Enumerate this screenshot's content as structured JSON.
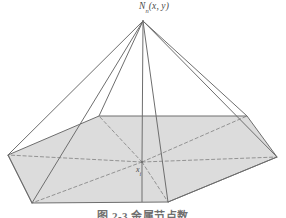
{
  "figure": {
    "domain": "geometric-diagram",
    "background_color": "#ffffff",
    "stroke_color": "#6e6e6e",
    "dashed_stroke_color": "#8a8a8a",
    "fill_color": "#dcdcdc",
    "label_color": "#4a4a4a",
    "caption_color": "#6f6f6f",
    "width": 286,
    "height": 218
  },
  "labels": {
    "apex_main": "N",
    "apex_subscript": "n",
    "apex_args": "(x, y)",
    "apex_full": "Nn(x, y)",
    "center_main": "x",
    "center_subscript": "i",
    "center_full": "xi"
  },
  "caption": {
    "text": "图 2-3  金属节点数"
  },
  "geometry": {
    "apex": {
      "x": 143,
      "y": 21,
      "name": "apex-node"
    },
    "base_hexagon": [
      {
        "name": "vertex-left",
        "x": 8,
        "y": 155
      },
      {
        "name": "vertex-top-left",
        "x": 99,
        "y": 116
      },
      {
        "name": "vertex-top-right",
        "x": 247,
        "y": 116
      },
      {
        "name": "vertex-right",
        "x": 277,
        "y": 157
      },
      {
        "name": "vertex-bottom-right",
        "x": 168,
        "y": 202
      },
      {
        "name": "vertex-bottom-left",
        "x": 32,
        "y": 203
      }
    ],
    "center_point": {
      "name": "center-node",
      "x": 142,
      "y": 162
    },
    "solid_edges_from_apex": [
      "vertex-left",
      "vertex-top-left",
      "vertex-top-right",
      "vertex-right",
      "vertex-bottom-right",
      "center-node"
    ],
    "dashed_diagonals_from_center": [
      "vertex-left",
      "vertex-top-left",
      "vertex-top-right",
      "vertex-right",
      "vertex-bottom-right",
      "vertex-bottom-left"
    ]
  }
}
